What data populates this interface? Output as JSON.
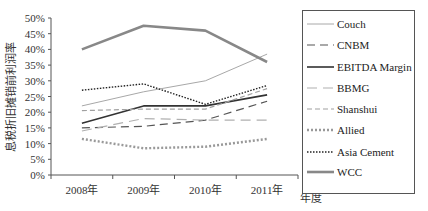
{
  "chart_data": {
    "type": "line",
    "title": "",
    "xlabel": "年度",
    "ylabel": "息税折旧摊销前利润率",
    "categories": [
      "2008年",
      "2009年",
      "2010年",
      "2011年"
    ],
    "yticks": [
      "0%",
      "5%",
      "10%",
      "15%",
      "20%",
      "25%",
      "30%",
      "35%",
      "40%",
      "45%",
      "50%"
    ],
    "ylim": [
      0,
      50
    ],
    "grid": false,
    "legend_position": "right",
    "series": [
      {
        "name": "Couch",
        "values": [
          22,
          26.5,
          30,
          38.5
        ],
        "color": "#a8a8a8",
        "width": 1,
        "dash": ""
      },
      {
        "name": "CNBM",
        "values": [
          15,
          15.5,
          17.5,
          23.5
        ],
        "color": "#555555",
        "width": 1.2,
        "dash": "8,5"
      },
      {
        "name": "EBITDA Margin",
        "values": [
          16.5,
          22,
          22,
          25.5
        ],
        "color": "#333333",
        "width": 1.6,
        "dash": ""
      },
      {
        "name": "BBMG",
        "values": [
          14,
          18,
          17.5,
          17.5
        ],
        "color": "#b0b0b0",
        "width": 1.2,
        "dash": "10,6"
      },
      {
        "name": "Shanshui",
        "values": [
          20.5,
          21,
          21,
          27.5
        ],
        "color": "#a0a0a0",
        "width": 1.2,
        "dash": "5,3"
      },
      {
        "name": "Allied",
        "values": [
          11.5,
          8.5,
          9,
          11.5
        ],
        "color": "#999999",
        "width": 2.4,
        "dash": "2,2"
      },
      {
        "name": "Asia Cement",
        "values": [
          27,
          29,
          22.5,
          28.5
        ],
        "color": "#222222",
        "width": 1.4,
        "dash": "1.5,1.5"
      },
      {
        "name": "WCC",
        "values": [
          40,
          47.5,
          46,
          36
        ],
        "color": "#888888",
        "width": 2.6,
        "dash": ""
      }
    ]
  }
}
